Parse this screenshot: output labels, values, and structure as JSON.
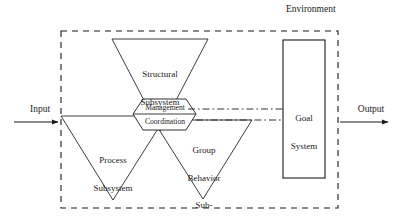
{
  "diagram": {
    "environment_label": "Environment",
    "input_label": "Input",
    "output_label": "Output",
    "colors": {
      "line": "#1a1a1a",
      "background": "#ffffff",
      "text": "#1a1a1a"
    },
    "boundary": {
      "name": "Environment boundary",
      "style": "dashed",
      "x": 61,
      "y": 31,
      "width": 277,
      "height": 177
    },
    "nodes": {
      "structural": {
        "shape": "inverted-triangle",
        "lines": [
          "Structural",
          "Subsystem"
        ]
      },
      "process": {
        "shape": "inverted-triangle",
        "lines": [
          "Process",
          "Subsystem"
        ]
      },
      "group_behavior": {
        "shape": "inverted-triangle",
        "lines": [
          "Group",
          "Behavior",
          "Sub-",
          "system"
        ]
      },
      "core": {
        "shape": "hexagon",
        "top_label": "Management",
        "bottom_label": "Coordination"
      },
      "goal_system": {
        "shape": "rectangle",
        "lines": [
          "Goal",
          "System"
        ],
        "x": 283,
        "y": 40,
        "width": 42,
        "height": 138
      }
    },
    "connectors": {
      "input_arrow": {
        "from_x": 14,
        "to_x": 61,
        "y": 122,
        "style": "solid-arrow"
      },
      "output_arrow": {
        "from_x": 338,
        "to_x": 390,
        "y": 122,
        "style": "solid-arrow"
      },
      "core_to_goal_upper": {
        "style": "dash-dot",
        "y": 111
      },
      "core_to_goal_lower": {
        "style": "dash-dot",
        "y": 120
      }
    }
  }
}
